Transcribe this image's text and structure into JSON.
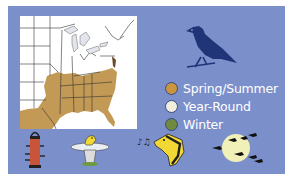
{
  "range_card": {
    "background_color": "#7b8fca",
    "map": {
      "description": "Eastern United States range map",
      "range_color": "#c39a55"
    },
    "bird_silhouette": {
      "icon": "perched-bird-icon",
      "color": "#1f3577"
    },
    "legend": [
      {
        "label": "Spring/Summer",
        "color": "#c9953d"
      },
      {
        "label": "Year-Round",
        "color": "#f1eedd"
      },
      {
        "label": "Winter",
        "color": "#6f8a3e"
      }
    ],
    "activity_icons": [
      {
        "icon": "bird-feeder-icon"
      },
      {
        "icon": "bird-bath-icon"
      },
      {
        "icon": "singing-bird-icon"
      },
      {
        "icon": "migration-moon-icon"
      }
    ]
  }
}
